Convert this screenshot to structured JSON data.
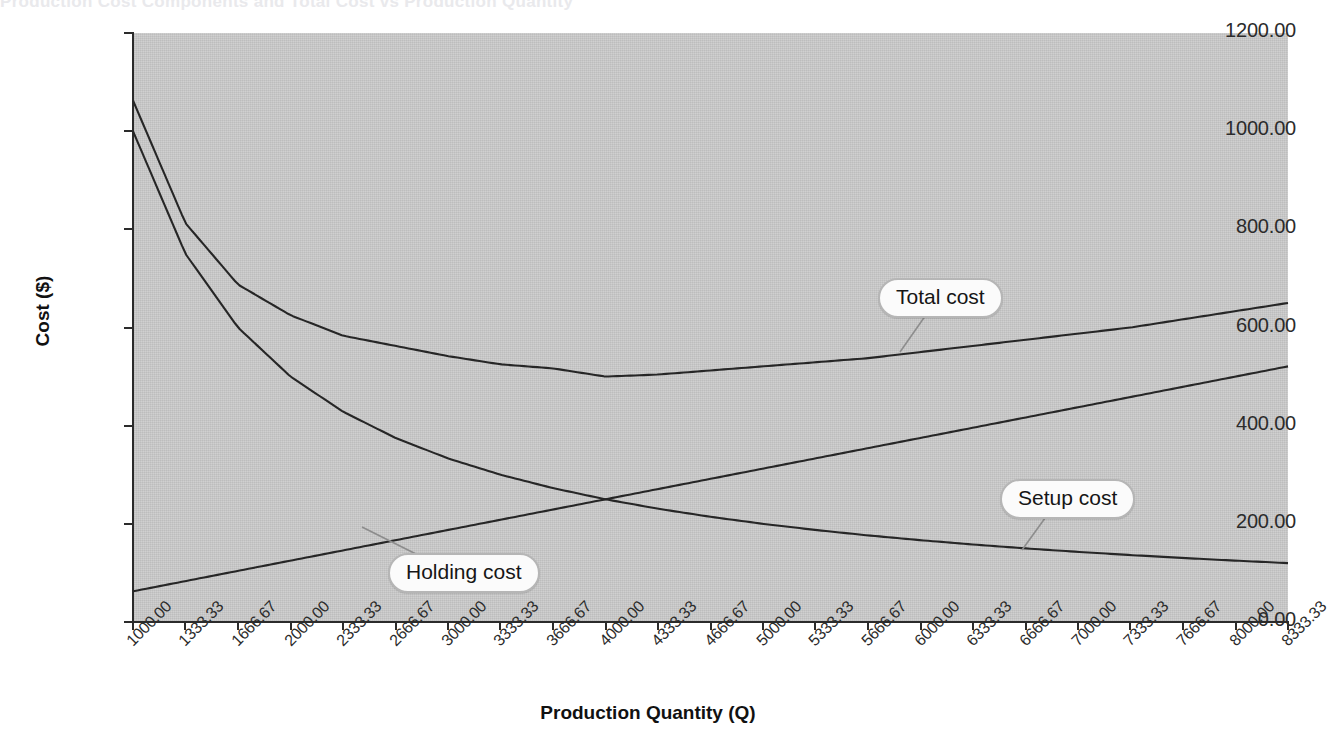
{
  "page": {
    "cut_off_title": "Production Cost Components and Total Cost vs Production Quantity"
  },
  "chart_data": {
    "type": "line",
    "title": "",
    "xlabel": "Production Quantity (Q)",
    "ylabel": "Cost ($)",
    "xlim": [
      1000,
      8333.33
    ],
    "ylim": [
      0,
      1200
    ],
    "grid": false,
    "legend_position": "inline-callouts",
    "ytick_labels": [
      "0.00",
      "200.00",
      "400.00",
      "600.00",
      "800.00",
      "1000.00",
      "1200.00"
    ],
    "ytick_values": [
      0,
      200,
      400,
      600,
      800,
      1000,
      1200
    ],
    "categories": [
      "1000.00",
      "1333.33",
      "1666.67",
      "2000.00",
      "2333.33",
      "2666.67",
      "3000.00",
      "3333.33",
      "3666.67",
      "4000.00",
      "4333.33",
      "4666.67",
      "5000.00",
      "5333.33",
      "5666.67",
      "6000.00",
      "6333.33",
      "6666.67",
      "7000.00",
      "7333.33",
      "7666.67",
      "8000.00",
      "8333.33"
    ],
    "x": [
      1000,
      1333.33,
      1666.67,
      2000,
      2333.33,
      2666.67,
      3000,
      3333.33,
      3666.67,
      4000,
      4333.33,
      4666.67,
      5000,
      5333.33,
      5666.67,
      6000,
      6333.33,
      6666.67,
      7000,
      7333.33,
      7666.67,
      8000,
      8333.33
    ],
    "series": [
      {
        "name": "Total cost",
        "label": "Total cost",
        "values": [
          1062.5,
          812.5,
          687.5,
          625.0,
          583.33,
          562.5,
          541.67,
          525.0,
          516.67,
          500.0,
          504.17,
          512.5,
          520.83,
          529.17,
          537.5,
          550.0,
          562.5,
          575.0,
          587.5,
          600.0,
          616.67,
          633.33,
          650.0
        ]
      },
      {
        "name": "Setup cost",
        "label": "Setup cost",
        "values": [
          1000.0,
          750.0,
          600.0,
          500.0,
          428.57,
          375.0,
          333.33,
          300.0,
          272.73,
          250.0,
          230.77,
          214.29,
          200.0,
          187.5,
          176.47,
          166.67,
          157.89,
          150.0,
          142.86,
          136.36,
          130.43,
          125.0,
          120.0
        ]
      },
      {
        "name": "Holding cost",
        "label": "Holding cost",
        "values": [
          62.5,
          83.33,
          104.17,
          125.0,
          145.83,
          166.67,
          187.5,
          208.33,
          229.17,
          250.0,
          270.83,
          291.67,
          312.5,
          333.33,
          354.17,
          375.0,
          395.83,
          416.67,
          437.5,
          458.33,
          479.17,
          500.0,
          520.83
        ]
      }
    ],
    "annotations": [
      {
        "name": "total-cost-callout",
        "text": "Total cost",
        "anchor_x": 6200,
        "anchor_y": 545
      },
      {
        "name": "setup-cost-callout",
        "text": "Setup cost",
        "anchor_x": 6900,
        "anchor_y": 155
      },
      {
        "name": "holding-cost-callout",
        "text": "Holding cost",
        "anchor_x": 2700,
        "anchor_y": 168
      }
    ],
    "colors": {
      "plot_background": "#cacaca",
      "line": "#262626",
      "axis": "#2b2b2b",
      "callout_fill": "#fbfbfb",
      "callout_border": "#b6b6b6",
      "page_background": "#ffffff"
    }
  }
}
